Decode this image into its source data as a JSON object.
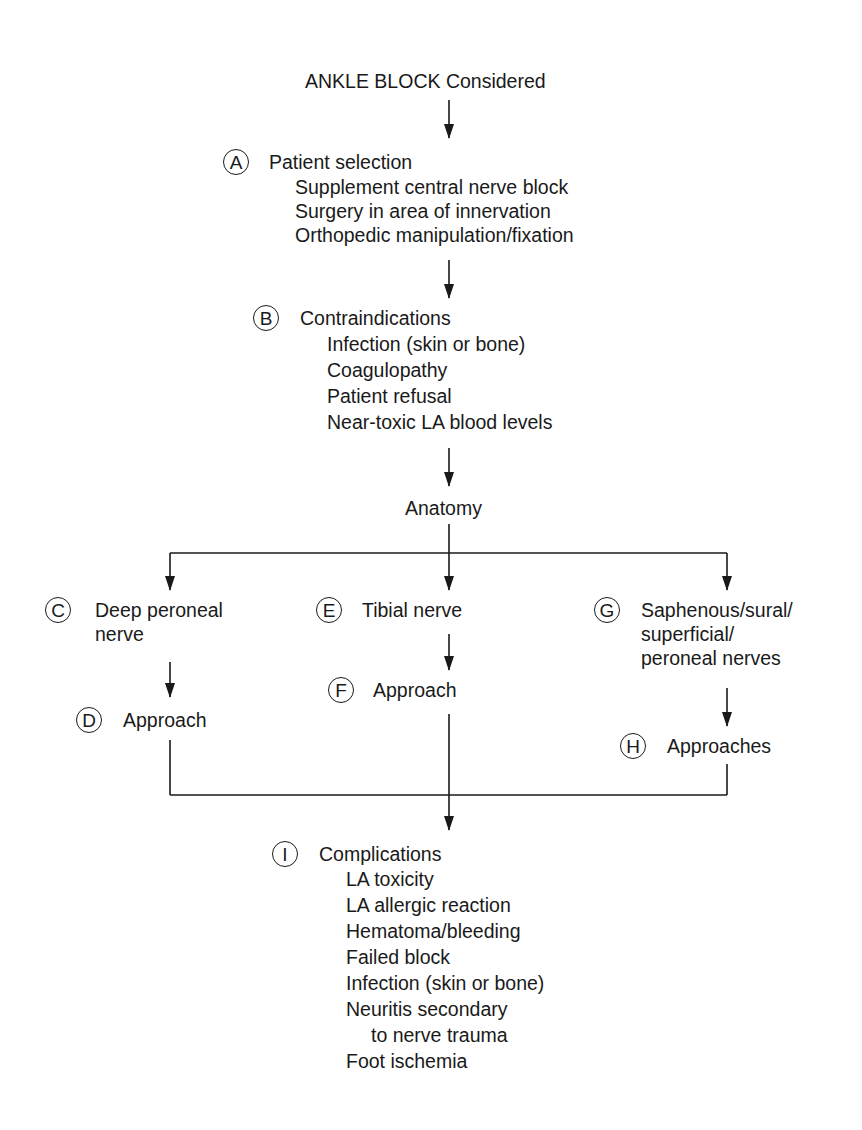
{
  "title": "ANKLE BLOCK Considered",
  "nodes": {
    "A": {
      "letter": "A",
      "heading": "Patient selection",
      "items": [
        "Supplement central nerve block",
        "Surgery in area of innervation",
        "Orthopedic manipulation/fixation"
      ]
    },
    "B": {
      "letter": "B",
      "heading": "Contraindications",
      "items": [
        "Infection (skin or bone)",
        "Coagulopathy",
        "Patient refusal",
        "Near-toxic LA blood levels"
      ]
    },
    "anatomy": {
      "heading": "Anatomy"
    },
    "C": {
      "letter": "C",
      "lines": [
        "Deep peroneal",
        "nerve"
      ]
    },
    "D": {
      "letter": "D",
      "heading": "Approach"
    },
    "E": {
      "letter": "E",
      "heading": "Tibial nerve"
    },
    "F": {
      "letter": "F",
      "heading": "Approach"
    },
    "G": {
      "letter": "G",
      "lines": [
        "Saphenous/sural/",
        "superficial/",
        "peroneal nerves"
      ]
    },
    "H": {
      "letter": "H",
      "heading": "Approaches"
    },
    "I": {
      "letter": "I",
      "heading": "Complications",
      "items": [
        "LA toxicity",
        "LA allergic reaction",
        "Hematoma/bleeding",
        "Failed block",
        "Infection (skin or bone)",
        "Neuritis secondary",
        "to nerve trauma",
        "Foot ischemia"
      ]
    }
  }
}
